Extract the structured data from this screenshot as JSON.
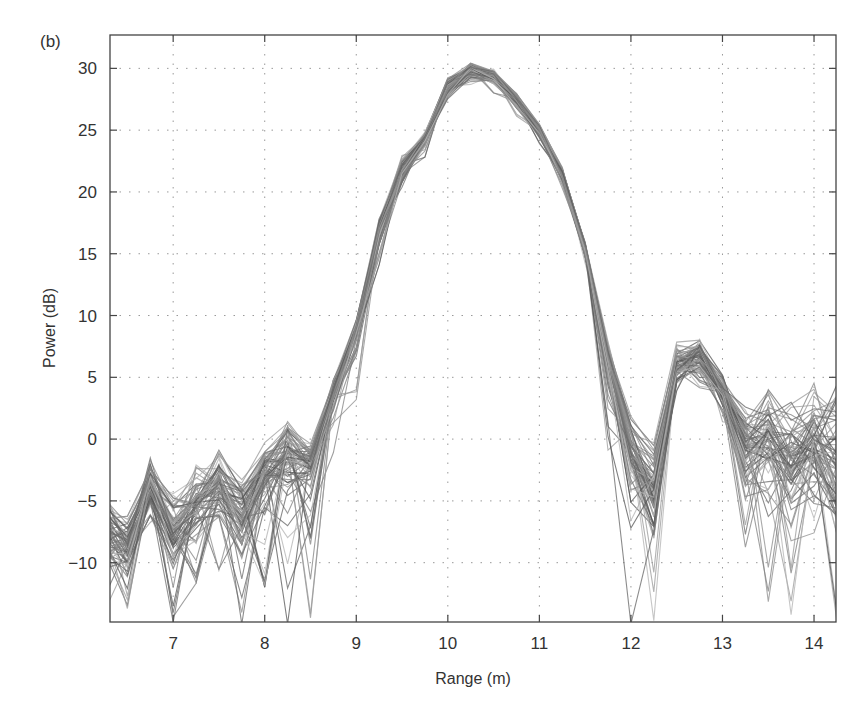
{
  "panel_label": "(b)",
  "chart_data": {
    "type": "line",
    "title": "",
    "xlabel": "Range (m)",
    "ylabel": "Power (dB)",
    "xlim": [
      6.31,
      14.24
    ],
    "ylim": [
      -14.8,
      32.7
    ],
    "xticks": [
      7,
      8,
      9,
      10,
      11,
      12,
      13,
      14
    ],
    "yticks": [
      30,
      25,
      20,
      15,
      10,
      5,
      0,
      -5,
      -10
    ],
    "ytick_labels": [
      "30",
      "25",
      "20",
      "15",
      "10",
      "5",
      "0",
      "−10",
      "−5"
    ],
    "grid": true,
    "grid_style": "dotted",
    "legend": "none",
    "series_description": "Many overlaid grayscale power-vs-range traces (ensemble of measurements)",
    "sample_spacing_m": 0.25,
    "envelope": {
      "x": [
        6.25,
        6.5,
        6.75,
        7.0,
        7.25,
        7.5,
        7.75,
        8.0,
        8.25,
        8.5,
        8.75,
        9.0,
        9.25,
        9.5,
        9.75,
        10.0,
        10.25,
        10.5,
        10.75,
        11.0,
        11.25,
        11.5,
        11.75,
        12.0,
        12.25,
        12.5,
        12.75,
        13.0,
        13.25,
        13.5,
        13.75,
        14.0,
        14.25
      ],
      "median": [
        -9,
        -10,
        -5,
        -9,
        -7,
        -5,
        -8,
        -4,
        -3,
        -3,
        3,
        8,
        16,
        21,
        24,
        28,
        29.5,
        29,
        27,
        24.5,
        21,
        15,
        6,
        -3,
        -6,
        5,
        6,
        3,
        -3,
        -2,
        -4,
        -3,
        -6
      ],
      "upper": [
        -4,
        -6,
        -1.5,
        -4,
        -2,
        -0.5,
        -3,
        0,
        1.5,
        0,
        5,
        10,
        18,
        23,
        25,
        29.5,
        30.5,
        30,
        28,
        25.5,
        22,
        16,
        8,
        2,
        0,
        8,
        8.5,
        5.5,
        3.5,
        5,
        3,
        5,
        5
      ],
      "lower": [
        -15,
        -15,
        -11,
        -15,
        -13,
        -11,
        -15,
        -12,
        -15,
        -15,
        -2,
        3,
        14,
        20,
        22.5,
        27,
        28.5,
        28,
        26,
        23.5,
        20,
        14,
        -1,
        -15,
        -15,
        3,
        3.5,
        -2,
        -12,
        -15,
        -15,
        -15,
        -15
      ]
    },
    "peak": {
      "x": 10.3,
      "y": 30.5
    },
    "sidelobe_right": {
      "x": 12.7,
      "y": 8.0
    },
    "nulls": [
      {
        "x": 12.0,
        "y": -15
      },
      {
        "x": 12.25,
        "y": -15
      }
    ],
    "trace_count_rendered": 70,
    "trace_colors": [
      "#555555",
      "#6e6e6e",
      "#808080",
      "#9a9a9a",
      "#b3b3b3",
      "#666666",
      "#8c8c8c"
    ]
  }
}
